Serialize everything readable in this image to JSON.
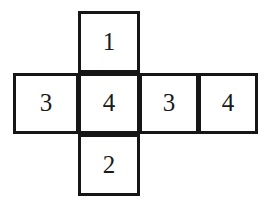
{
  "diagram": {
    "name": "cube-net",
    "shape": "cross-shaped net of squares",
    "background_color": "#ffffff",
    "stroke_color": "#161616",
    "text_color": "#1a1a1a",
    "stroke_width_px": 3,
    "rows": {
      "top": {
        "cells": [
          {
            "id": "top",
            "label": "1"
          }
        ]
      },
      "middle": {
        "cells": [
          {
            "id": "mid-1",
            "label": "3"
          },
          {
            "id": "mid-2",
            "label": "4"
          },
          {
            "id": "mid-3",
            "label": "3"
          },
          {
            "id": "mid-4",
            "label": "4"
          }
        ]
      },
      "bottom": {
        "cells": [
          {
            "id": "bottom",
            "label": "2"
          }
        ]
      }
    }
  }
}
